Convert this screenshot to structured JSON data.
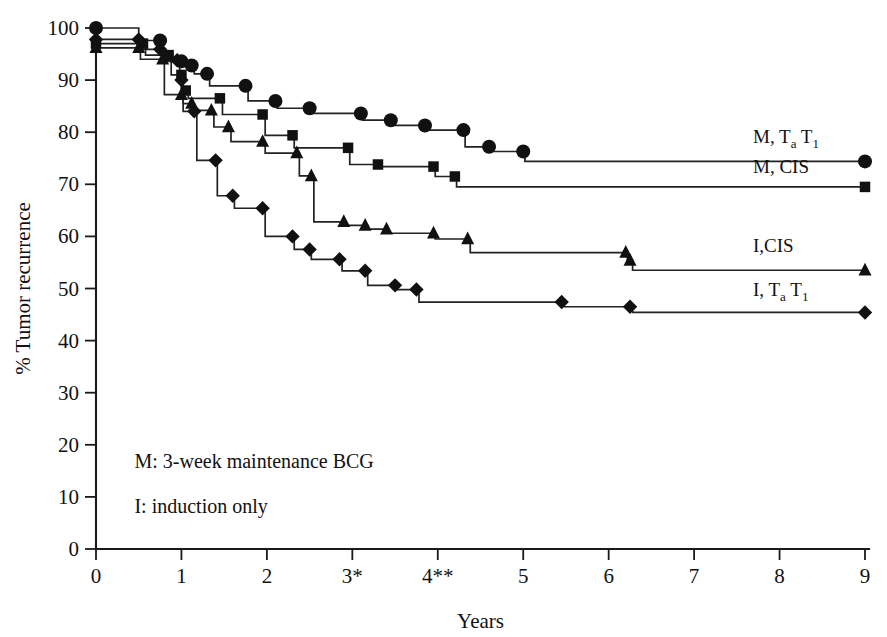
{
  "chart_data": {
    "type": "line",
    "title": "",
    "xlabel": "Years",
    "ylabel": "% Tumor recurrence",
    "xlim": [
      0,
      9
    ],
    "ylim": [
      0,
      100
    ],
    "grid": false,
    "legend_position": "right-inline",
    "x_ticks": [
      "0",
      "1",
      "2",
      "3*",
      "4**",
      "5",
      "6",
      "7",
      "8",
      "9"
    ],
    "x_tick_values": [
      0,
      1,
      2,
      3,
      4,
      5,
      6,
      7,
      8,
      9
    ],
    "y_ticks": [
      "0",
      "10",
      "20",
      "30",
      "40",
      "50",
      "60",
      "70",
      "80",
      "90",
      "100"
    ],
    "y_tick_values": [
      0,
      10,
      20,
      30,
      40,
      50,
      60,
      70,
      80,
      90,
      100
    ],
    "annotations": [
      {
        "name": "maintenance-note",
        "text": "M: 3-week maintenance BCG",
        "x": 0.45,
        "y": 15.5
      },
      {
        "name": "induction-note",
        "text": "I: induction only",
        "x": 0.45,
        "y": 7.0
      }
    ],
    "series": [
      {
        "name": "M, TaT1",
        "label_main": "M, T",
        "label_sub1": "a",
        "label_mid": " T",
        "label_sub2": "1",
        "marker": "circle",
        "label_x": 9.05,
        "label_y": 78.0,
        "points": [
          [
            0.0,
            100.0
          ],
          [
            0.5,
            97.6
          ],
          [
            0.75,
            97.6
          ],
          [
            0.78,
            93.6
          ],
          [
            1.0,
            93.6
          ],
          [
            1.02,
            92.8
          ],
          [
            1.12,
            92.8
          ],
          [
            1.15,
            91.2
          ],
          [
            1.3,
            91.2
          ],
          [
            1.33,
            88.9
          ],
          [
            1.75,
            88.9
          ],
          [
            1.78,
            86.0
          ],
          [
            2.1,
            86.0
          ],
          [
            2.12,
            84.6
          ],
          [
            2.5,
            84.6
          ],
          [
            2.52,
            83.6
          ],
          [
            3.1,
            83.6
          ],
          [
            3.12,
            82.3
          ],
          [
            3.45,
            82.3
          ],
          [
            3.47,
            81.3
          ],
          [
            3.85,
            81.3
          ],
          [
            3.87,
            80.4
          ],
          [
            4.3,
            80.4
          ],
          [
            4.32,
            77.2
          ],
          [
            4.6,
            77.2
          ],
          [
            4.62,
            76.3
          ],
          [
            5.0,
            76.3
          ],
          [
            5.02,
            74.4
          ],
          [
            9.0,
            74.4
          ]
        ]
      },
      {
        "name": "M, CIS",
        "label_main": "M, CIS",
        "marker": "square",
        "label_x": 9.05,
        "label_y": 72.2,
        "points": [
          [
            0.0,
            97.0
          ],
          [
            0.55,
            97.0
          ],
          [
            0.58,
            94.8
          ],
          [
            0.85,
            94.8
          ],
          [
            0.88,
            91.0
          ],
          [
            1.0,
            91.0
          ],
          [
            1.02,
            88.0
          ],
          [
            1.05,
            88.0
          ],
          [
            1.08,
            86.5
          ],
          [
            1.45,
            86.5
          ],
          [
            1.48,
            83.4
          ],
          [
            1.95,
            83.4
          ],
          [
            1.98,
            79.4
          ],
          [
            2.3,
            79.4
          ],
          [
            2.32,
            77.0
          ],
          [
            2.95,
            77.0
          ],
          [
            2.97,
            73.8
          ],
          [
            3.3,
            73.8
          ],
          [
            3.32,
            73.4
          ],
          [
            3.95,
            73.4
          ],
          [
            3.97,
            71.5
          ],
          [
            4.2,
            71.5
          ],
          [
            4.22,
            69.5
          ],
          [
            9.0,
            69.5
          ]
        ]
      },
      {
        "name": "I,CIS",
        "label_main": "I,CIS",
        "marker": "triangle",
        "label_x": 9.05,
        "label_y": 57.0,
        "points": [
          [
            0.0,
            96.2
          ],
          [
            0.5,
            96.2
          ],
          [
            0.52,
            94.0
          ],
          [
            0.78,
            94.0
          ],
          [
            0.8,
            87.2
          ],
          [
            1.0,
            87.2
          ],
          [
            1.02,
            85.5
          ],
          [
            1.12,
            85.5
          ],
          [
            1.15,
            84.2
          ],
          [
            1.35,
            84.2
          ],
          [
            1.38,
            81.0
          ],
          [
            1.55,
            81.0
          ],
          [
            1.58,
            78.2
          ],
          [
            1.95,
            78.2
          ],
          [
            1.98,
            76.0
          ],
          [
            2.35,
            76.0
          ],
          [
            2.38,
            71.6
          ],
          [
            2.52,
            71.6
          ],
          [
            2.55,
            62.8
          ],
          [
            2.9,
            62.8
          ],
          [
            2.92,
            62.1
          ],
          [
            3.15,
            62.1
          ],
          [
            3.18,
            61.4
          ],
          [
            3.4,
            61.4
          ],
          [
            3.42,
            60.6
          ],
          [
            3.95,
            60.6
          ],
          [
            3.97,
            59.5
          ],
          [
            4.35,
            59.5
          ],
          [
            4.38,
            56.9
          ],
          [
            6.2,
            56.9
          ],
          [
            6.22,
            55.4
          ],
          [
            6.25,
            55.4
          ],
          [
            6.28,
            53.5
          ],
          [
            9.0,
            53.5
          ]
        ]
      },
      {
        "name": "I, TaT1",
        "label_main": "I, T",
        "label_sub1": "a",
        "label_mid": " T",
        "label_sub2": "1",
        "marker": "diamond",
        "label_x": 9.05,
        "label_y": 48.5,
        "points": [
          [
            0.0,
            97.8
          ],
          [
            0.5,
            97.8
          ],
          [
            0.52,
            95.9
          ],
          [
            0.75,
            95.9
          ],
          [
            0.78,
            93.8
          ],
          [
            0.95,
            93.8
          ],
          [
            0.98,
            90.0
          ],
          [
            1.0,
            90.0
          ],
          [
            1.02,
            84.0
          ],
          [
            1.15,
            84.0
          ],
          [
            1.18,
            74.6
          ],
          [
            1.4,
            74.6
          ],
          [
            1.42,
            67.8
          ],
          [
            1.6,
            67.8
          ],
          [
            1.62,
            65.4
          ],
          [
            1.95,
            65.4
          ],
          [
            1.98,
            60.0
          ],
          [
            2.3,
            60.0
          ],
          [
            2.32,
            57.5
          ],
          [
            2.5,
            57.5
          ],
          [
            2.52,
            55.6
          ],
          [
            2.85,
            55.6
          ],
          [
            2.88,
            53.4
          ],
          [
            3.15,
            53.4
          ],
          [
            3.18,
            50.6
          ],
          [
            3.5,
            50.6
          ],
          [
            3.52,
            49.8
          ],
          [
            3.75,
            49.8
          ],
          [
            3.78,
            47.4
          ],
          [
            5.45,
            47.4
          ],
          [
            5.48,
            46.5
          ],
          [
            6.25,
            46.5
          ],
          [
            6.28,
            45.4
          ],
          [
            9.0,
            45.4
          ]
        ]
      }
    ]
  },
  "axes": {
    "y_title": "% Tumor recurrence",
    "x_title": "Years"
  }
}
